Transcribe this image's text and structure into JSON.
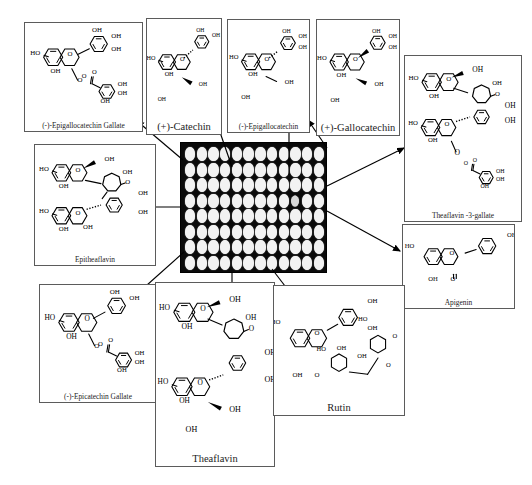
{
  "figure": {
    "type": "annotated-micrograph",
    "center_label": "96-well microplate array",
    "background": "#ffffff",
    "stroke": "#000000"
  },
  "plate": {
    "name": "96-well-plate",
    "rows": 8,
    "cols": 12,
    "well_color": "#f2f2f2",
    "plate_color": "#0a0a0a",
    "dim_wells": [
      [
        3,
        9
      ]
    ]
  },
  "panels": [
    {
      "id": "epigallocatechin-gallate",
      "label": "(-)-Epigallocatechin Gallate",
      "label_size": "small",
      "x": 24,
      "y": 22,
      "w": 119,
      "h": 110
    },
    {
      "id": "catechin",
      "label": "(+)-Catechin",
      "label_size": "big",
      "x": 146,
      "y": 18,
      "w": 76,
      "h": 117
    },
    {
      "id": "epigallocatechin",
      "label": "(-)-Epigallocatechin",
      "label_size": "small",
      "x": 227,
      "y": 19,
      "w": 83,
      "h": 114
    },
    {
      "id": "gallocatechin",
      "label": "(+)-Gallocatechin",
      "label_size": "big",
      "x": 316,
      "y": 19,
      "w": 84,
      "h": 117
    },
    {
      "id": "theaflavin-3-gallate",
      "label": "Theaflavin -3-gallate",
      "label_size": "small",
      "x": 404,
      "y": 55,
      "w": 118,
      "h": 167
    },
    {
      "id": "epitheaflavin",
      "label": "Epitheaflavin",
      "label_size": "small",
      "x": 34,
      "y": 144,
      "w": 122,
      "h": 122
    },
    {
      "id": "apigenin",
      "label": "Apigenin",
      "label_size": "small",
      "x": 402,
      "y": 224,
      "w": 113,
      "h": 85
    },
    {
      "id": "epicatechin-gallate",
      "label": "(-)-Epicatechin Gallate",
      "label_size": "small",
      "x": 39,
      "y": 284,
      "w": 118,
      "h": 119
    },
    {
      "id": "theaflavin",
      "label": "Theaflavin",
      "label_size": "big",
      "x": 155,
      "y": 282,
      "w": 120,
      "h": 185
    },
    {
      "id": "rutin",
      "label": "Rutin",
      "label_size": "big",
      "x": 273,
      "y": 285,
      "w": 132,
      "h": 131
    }
  ],
  "arrows": [
    {
      "id": "arrow-to-epigallocatechin-gallate",
      "x1": 183,
      "y1": 160,
      "x2": 137,
      "y2": 121
    },
    {
      "id": "arrow-to-catechin",
      "x1": 232,
      "y1": 167,
      "x2": 213,
      "y2": 112
    },
    {
      "id": "arrow-to-epigallocatechin",
      "x1": 289,
      "y1": 175,
      "x2": 289,
      "y2": 96
    },
    {
      "id": "arrow-to-gallocatechin",
      "x1": 327,
      "y1": 148,
      "x2": 308,
      "y2": 120
    },
    {
      "id": "arrow-to-theaflavin-3-gallate",
      "x1": 327,
      "y1": 186,
      "x2": 404,
      "y2": 148
    },
    {
      "id": "arrow-to-epitheaflavin",
      "x1": 181,
      "y1": 207,
      "x2": 132,
      "y2": 207
    },
    {
      "id": "arrow-to-apigenin",
      "x1": 327,
      "y1": 211,
      "x2": 400,
      "y2": 251
    },
    {
      "id": "arrow-to-epicatechin-gallate",
      "x1": 184,
      "y1": 252,
      "x2": 119,
      "y2": 310
    },
    {
      "id": "arrow-to-theaflavin",
      "x1": 232,
      "y1": 273,
      "x2": 232,
      "y2": 298
    },
    {
      "id": "arrow-to-rutin",
      "x1": 272,
      "y1": 269,
      "x2": 298,
      "y2": 303
    }
  ],
  "chemistry": {
    "OH": "OH",
    "HO": "HO",
    "O": "O"
  }
}
